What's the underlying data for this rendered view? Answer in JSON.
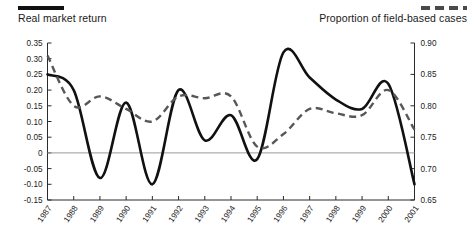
{
  "legend": {
    "left": {
      "label": "Real market return",
      "style": "solid",
      "color": "#111111"
    },
    "right": {
      "label": "Proportion of field-based cases",
      "style": "dashed",
      "color": "#575757"
    }
  },
  "chart_data": {
    "type": "line",
    "title": "",
    "xlabel": "",
    "ylabel": "",
    "grid": false,
    "legend_position": "top",
    "zero_line": true,
    "categories": [
      "1987",
      "1988",
      "1989",
      "1990",
      "1991",
      "1992",
      "1993",
      "1994",
      "1995",
      "1996",
      "1997",
      "1998",
      "1999",
      "2000",
      "2001"
    ],
    "axes": {
      "left": {
        "label": "Real market return",
        "ylim": [
          -0.15,
          0.35
        ],
        "ticks": [
          "0.35",
          "0.30",
          "0.25",
          "0.20",
          "0.15",
          "0.10",
          "0.05",
          "0",
          "-0.05",
          "-0.10",
          "-0.15"
        ],
        "tick_values": [
          0.35,
          0.3,
          0.25,
          0.2,
          0.15,
          0.1,
          0.05,
          0,
          -0.05,
          -0.1,
          -0.15
        ]
      },
      "right": {
        "label": "Proportion of field-based cases",
        "ylim": [
          0.65,
          0.9
        ],
        "ticks": [
          "0.90",
          "0.85",
          "0.80",
          "0.75",
          "0.70",
          "0.65"
        ],
        "tick_values": [
          0.9,
          0.85,
          0.8,
          0.75,
          0.7,
          0.65
        ]
      }
    },
    "series": [
      {
        "name": "Real market return",
        "axis": "left",
        "style": "solid",
        "color": "#111111",
        "values": [
          0.25,
          0.2,
          -0.08,
          0.16,
          -0.1,
          0.2,
          0.04,
          0.12,
          -0.02,
          0.32,
          0.24,
          0.17,
          0.14,
          0.22,
          -0.1
        ]
      },
      {
        "name": "Proportion of field-based cases",
        "axis": "right",
        "style": "dashed",
        "color": "#575757",
        "values": [
          0.88,
          0.8,
          0.815,
          0.795,
          0.775,
          0.815,
          0.812,
          0.815,
          0.735,
          0.755,
          0.795,
          0.788,
          0.785,
          0.825,
          0.762
        ]
      }
    ]
  }
}
